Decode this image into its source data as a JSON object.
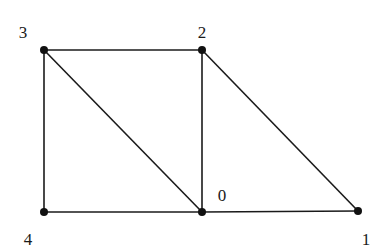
{
  "graph": {
    "nodes": [
      {
        "id": "0",
        "x": 202,
        "y": 212,
        "label": "0",
        "lx": 222,
        "ly": 201
      },
      {
        "id": "1",
        "x": 358,
        "y": 211,
        "label": "1",
        "lx": 366,
        "ly": 245
      },
      {
        "id": "2",
        "x": 202,
        "y": 50,
        "label": "2",
        "lx": 202,
        "ly": 38
      },
      {
        "id": "3",
        "x": 44,
        "y": 50,
        "label": "3",
        "lx": 23,
        "ly": 38
      },
      {
        "id": "4",
        "x": 44,
        "y": 212,
        "label": "4",
        "lx": 28,
        "ly": 245
      }
    ],
    "edges": [
      [
        "3",
        "2"
      ],
      [
        "3",
        "4"
      ],
      [
        "3",
        "0"
      ],
      [
        "2",
        "0"
      ],
      [
        "2",
        "1"
      ],
      [
        "4",
        "0"
      ],
      [
        "0",
        "1"
      ]
    ],
    "colors": {
      "edge": "#1a1a1a",
      "node": "#111111",
      "background": "#ffffff"
    }
  }
}
